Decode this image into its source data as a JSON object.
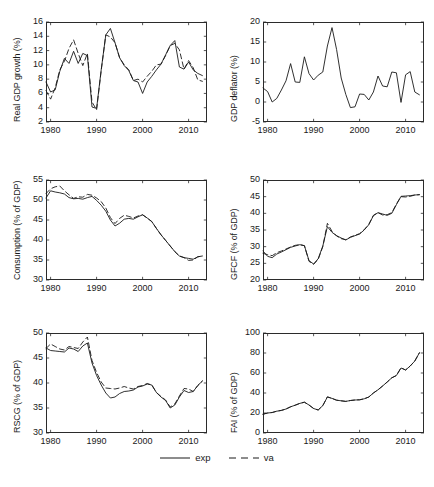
{
  "figure": {
    "width": 434,
    "height": 487,
    "background": "#ffffff",
    "line_color": "#1a1a1a",
    "axis_color": "#2b2b2b"
  },
  "legend": {
    "position": "bottom-center",
    "entries": [
      {
        "label": "exp",
        "style": "solid",
        "series_key": "exp"
      },
      {
        "label": "va",
        "style": "dashed",
        "series_key": "va"
      }
    ]
  },
  "chart_data": [
    {
      "id": "real-gdp-growth",
      "type": "line",
      "title": "",
      "xlabel": "",
      "ylabel": "Real GDP growth (%)",
      "xlim": [
        1979,
        2014
      ],
      "ylim": [
        2,
        16
      ],
      "xticks": [
        1980,
        1990,
        2000,
        2010
      ],
      "yticks": [
        2,
        4,
        6,
        8,
        10,
        12,
        14,
        16
      ],
      "grid": false,
      "x": [
        1979,
        1980,
        1981,
        1982,
        1983,
        1984,
        1985,
        1986,
        1987,
        1988,
        1989,
        1990,
        1991,
        1992,
        1993,
        1994,
        1995,
        1996,
        1997,
        1998,
        1999,
        2000,
        2001,
        2002,
        2003,
        2004,
        2005,
        2006,
        2007,
        2008,
        2009,
        2010,
        2011,
        2012,
        2013
      ],
      "series": [
        {
          "name": "exp",
          "style": "solid",
          "values": [
            7.6,
            6.2,
            6.5,
            9.1,
            10.9,
            10.2,
            11.9,
            10.2,
            11.6,
            11.3,
            4.1,
            3.9,
            9.3,
            14.2,
            15.1,
            13.1,
            11.0,
            9.9,
            9.2,
            7.8,
            7.6,
            6.0,
            7.6,
            8.4,
            9.3,
            10.1,
            11.4,
            12.7,
            13.4,
            9.7,
            9.4,
            10.4,
            9.3,
            8.8,
            8.5
          ],
          "marker": "none",
          "linewidth": 0.9
        },
        {
          "name": "va",
          "style": "dashed",
          "values": [
            6.4,
            5.2,
            6.8,
            9.3,
            10.5,
            12.3,
            13.5,
            11.6,
            9.9,
            11.6,
            4.8,
            3.7,
            9.2,
            14.2,
            13.9,
            13.1,
            11.0,
            10.0,
            9.3,
            7.8,
            8.0,
            7.6,
            8.4,
            9.1,
            10.0,
            10.1,
            11.3,
            12.7,
            13.0,
            12.1,
            9.4,
            10.6,
            9.6,
            7.9,
            7.7
          ],
          "marker": "none",
          "linewidth": 0.9
        }
      ]
    },
    {
      "id": "gdp-deflator",
      "type": "line",
      "title": "",
      "xlabel": "",
      "ylabel": "GDP deflator (%)",
      "xlim": [
        1979,
        2014
      ],
      "ylim": [
        -5,
        20
      ],
      "xticks": [
        1980,
        1990,
        2000,
        2010
      ],
      "yticks": [
        -5,
        0,
        5,
        10,
        15,
        20
      ],
      "grid": false,
      "x": [
        1979,
        1980,
        1981,
        1982,
        1983,
        1984,
        1985,
        1986,
        1987,
        1988,
        1989,
        1990,
        1991,
        1992,
        1993,
        1994,
        1995,
        1996,
        1997,
        1998,
        1999,
        2000,
        2001,
        2002,
        2003,
        2004,
        2005,
        2006,
        2007,
        2008,
        2009,
        2010,
        2011,
        2012,
        2013
      ],
      "series": [
        {
          "name": "exp",
          "style": "solid",
          "values": [
            3.5,
            2.6,
            0.0,
            0.9,
            3.0,
            5.3,
            9.6,
            5.0,
            4.9,
            11.3,
            7.1,
            5.5,
            6.7,
            7.5,
            14.0,
            18.6,
            13.1,
            6.0,
            1.9,
            -1.4,
            -1.2,
            2.0,
            1.9,
            0.5,
            2.5,
            6.5,
            4.0,
            3.8,
            7.5,
            7.3,
            -0.1,
            6.8,
            7.6,
            2.5,
            1.8
          ],
          "marker": "none",
          "linewidth": 0.9
        }
      ]
    },
    {
      "id": "consumption-share",
      "type": "line",
      "title": "",
      "xlabel": "",
      "ylabel": "Consumption (% of GDP)",
      "xlim": [
        1979,
        2014
      ],
      "ylim": [
        30,
        55
      ],
      "xticks": [
        1980,
        1990,
        2000,
        2010
      ],
      "yticks": [
        30,
        35,
        40,
        45,
        50,
        55
      ],
      "grid": false,
      "x": [
        1979,
        1980,
        1981,
        1982,
        1983,
        1984,
        1985,
        1986,
        1987,
        1988,
        1989,
        1990,
        1991,
        1992,
        1993,
        1994,
        1995,
        1996,
        1997,
        1998,
        1999,
        2000,
        2001,
        2002,
        2003,
        2004,
        2005,
        2006,
        2007,
        2008,
        2009,
        2010,
        2011,
        2012,
        2013
      ],
      "series": [
        {
          "name": "exp",
          "style": "solid",
          "values": [
            50.5,
            52.3,
            52.0,
            51.8,
            51.5,
            50.6,
            50.3,
            50.4,
            50.2,
            50.6,
            50.9,
            49.9,
            48.7,
            47.2,
            45.0,
            43.5,
            44.2,
            45.2,
            45.4,
            45.2,
            45.8,
            46.3,
            45.5,
            44.6,
            42.9,
            41.3,
            39.9,
            38.5,
            37.1,
            36.0,
            35.6,
            35.4,
            35.2,
            35.8,
            36.0
          ],
          "marker": "none",
          "linewidth": 0.9
        },
        {
          "name": "va",
          "style": "dashed",
          "values": [
            51.6,
            52.8,
            53.3,
            53.5,
            52.3,
            51.3,
            50.4,
            50.8,
            50.7,
            51.4,
            51.2,
            50.5,
            49.6,
            48.0,
            45.6,
            44.1,
            45.4,
            46.2,
            45.9,
            45.5,
            46.0,
            46.3,
            45.5,
            44.6,
            42.9,
            41.3,
            39.9,
            38.5,
            37.1,
            36.0,
            35.6,
            34.9,
            35.0,
            35.8,
            36.0
          ],
          "marker": "none",
          "linewidth": 0.9
        }
      ]
    },
    {
      "id": "gfcf-share",
      "type": "line",
      "title": "",
      "xlabel": "",
      "ylabel": "GFCF (% of GDP)",
      "xlim": [
        1979,
        2014
      ],
      "ylim": [
        20,
        50
      ],
      "xticks": [
        1980,
        1990,
        2000,
        2010
      ],
      "yticks": [
        20,
        25,
        30,
        35,
        40,
        45,
        50
      ],
      "grid": false,
      "x": [
        1979,
        1980,
        1981,
        1982,
        1983,
        1984,
        1985,
        1986,
        1987,
        1988,
        1989,
        1990,
        1991,
        1992,
        1993,
        1994,
        1995,
        1996,
        1997,
        1998,
        1999,
        2000,
        2001,
        2002,
        2003,
        2004,
        2005,
        2006,
        2007,
        2008,
        2009,
        2010,
        2011,
        2012,
        2013
      ],
      "series": [
        {
          "name": "exp",
          "style": "solid",
          "values": [
            28.7,
            27.1,
            26.7,
            27.8,
            28.4,
            29.1,
            29.8,
            30.2,
            30.6,
            30.3,
            25.8,
            24.8,
            26.4,
            30.2,
            36.0,
            34.3,
            33.3,
            32.6,
            32.0,
            32.8,
            33.3,
            33.8,
            35.0,
            36.6,
            39.3,
            40.2,
            39.8,
            39.4,
            40.0,
            42.6,
            45.1,
            45.2,
            45.3,
            45.5,
            45.6
          ],
          "marker": "none",
          "linewidth": 0.9
        },
        {
          "name": "va",
          "style": "dashed",
          "values": [
            28.0,
            27.6,
            27.3,
            28.2,
            28.7,
            29.3,
            29.9,
            30.4,
            30.6,
            30.3,
            25.6,
            24.7,
            26.2,
            30.0,
            37.0,
            34.6,
            33.2,
            32.4,
            32.1,
            32.9,
            33.4,
            33.9,
            35.1,
            36.7,
            39.4,
            40.2,
            39.5,
            39.6,
            40.2,
            42.8,
            45.0,
            44.9,
            45.1,
            45.5,
            45.6
          ],
          "marker": "none",
          "linewidth": 0.9
        }
      ]
    },
    {
      "id": "rscg-share",
      "type": "line",
      "title": "",
      "xlabel": "",
      "ylabel": "RSCG (% of GDP)",
      "xlim": [
        1979,
        2014
      ],
      "ylim": [
        30,
        50
      ],
      "xticks": [
        1980,
        1990,
        2000,
        2010
      ],
      "yticks": [
        30,
        35,
        40,
        45,
        50
      ],
      "grid": false,
      "x": [
        1979,
        1980,
        1981,
        1982,
        1983,
        1984,
        1985,
        1986,
        1987,
        1988,
        1989,
        1990,
        1991,
        1992,
        1993,
        1994,
        1995,
        1996,
        1997,
        1998,
        1999,
        2000,
        2001,
        2002,
        2003,
        2004,
        2005,
        2006,
        2007,
        2008,
        2009,
        2010,
        2011,
        2012,
        2013
      ],
      "series": [
        {
          "name": "exp",
          "style": "solid",
          "values": [
            47.0,
            46.5,
            46.4,
            46.3,
            46.2,
            47.0,
            46.8,
            46.3,
            47.4,
            48.0,
            44.0,
            41.5,
            39.6,
            38.0,
            37.0,
            37.2,
            37.9,
            38.3,
            38.4,
            38.6,
            39.2,
            39.4,
            39.8,
            39.6,
            38.1,
            37.2,
            36.5,
            35.0,
            35.6,
            37.2,
            38.5,
            38.1,
            38.3,
            39.5,
            40.4
          ],
          "marker": "none",
          "linewidth": 0.9
        },
        {
          "name": "va",
          "style": "dashed",
          "values": [
            46.9,
            47.8,
            47.3,
            46.8,
            46.6,
            47.3,
            47.1,
            46.9,
            48.2,
            49.2,
            44.5,
            42.1,
            40.2,
            39.0,
            38.9,
            38.8,
            39.0,
            39.3,
            39.0,
            38.8,
            39.3,
            39.5,
            39.9,
            39.6,
            38.1,
            37.3,
            36.6,
            35.2,
            35.8,
            37.4,
            38.9,
            38.8,
            38.3,
            39.5,
            40.4
          ],
          "marker": "none",
          "linewidth": 0.9
        }
      ]
    },
    {
      "id": "fai-share",
      "type": "line",
      "title": "",
      "xlabel": "",
      "ylabel": "FAI (% of GDP)",
      "xlim": [
        1979,
        2014
      ],
      "ylim": [
        0,
        100
      ],
      "xticks": [
        1980,
        1990,
        2000,
        2010
      ],
      "yticks": [
        0,
        20,
        40,
        60,
        80,
        100
      ],
      "grid": false,
      "x": [
        1979,
        1980,
        1981,
        1982,
        1983,
        1984,
        1985,
        1986,
        1987,
        1988,
        1989,
        1990,
        1991,
        1992,
        1993,
        1994,
        1995,
        1996,
        1997,
        1998,
        1999,
        2000,
        2001,
        2002,
        2003,
        2004,
        2005,
        2006,
        2007,
        2008,
        2009,
        2010,
        2011,
        2012,
        2013
      ],
      "series": [
        {
          "name": "exp",
          "style": "solid",
          "values": [
            18.8,
            20.0,
            20.5,
            21.8,
            22.6,
            24.0,
            26.2,
            27.8,
            29.6,
            30.8,
            28.0,
            24.5,
            23.0,
            27.4,
            36.0,
            34.6,
            32.8,
            32.2,
            31.6,
            32.5,
            33.0,
            33.2,
            34.2,
            36.0,
            40.0,
            43.2,
            47.0,
            51.0,
            55.2,
            57.5,
            65.0,
            63.0,
            67.0,
            72.0,
            80.2
          ],
          "marker": "none",
          "linewidth": 0.9
        },
        {
          "name": "va",
          "style": "dashed",
          "values": [
            18.8,
            20.0,
            20.5,
            21.8,
            22.6,
            24.0,
            26.2,
            27.8,
            29.6,
            30.8,
            28.0,
            24.5,
            23.0,
            27.4,
            36.2,
            34.6,
            32.8,
            32.2,
            31.6,
            32.5,
            33.0,
            33.2,
            34.2,
            36.0,
            40.0,
            43.2,
            47.0,
            51.0,
            55.2,
            57.5,
            65.2,
            63.0,
            67.0,
            72.0,
            80.2
          ],
          "marker": "none",
          "linewidth": 0.9
        }
      ]
    }
  ]
}
